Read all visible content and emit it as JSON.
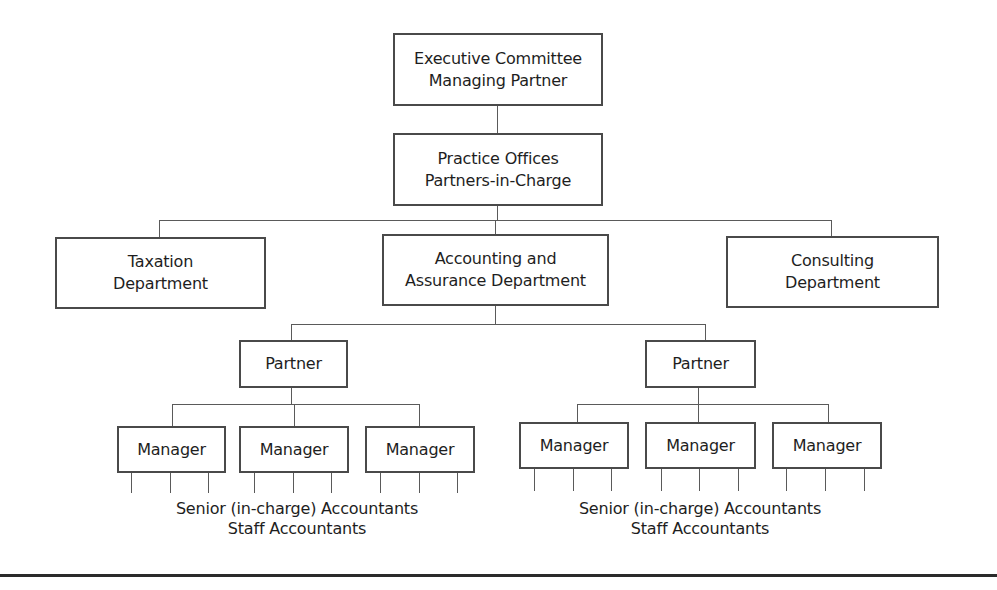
{
  "diagram": {
    "type": "org-chart",
    "title": "",
    "nodes": {
      "executive": {
        "line1": "Executive Committee",
        "line2": "Managing Partner"
      },
      "practice": {
        "line1": "Practice Offices",
        "line2": "Partners-in-Charge"
      },
      "taxation": {
        "line1": "Taxation",
        "line2": "Department"
      },
      "accounting": {
        "line1": "Accounting and",
        "line2": "Assurance Department"
      },
      "consulting": {
        "line1": "Consulting",
        "line2": "Department"
      },
      "partner_left": {
        "label": "Partner"
      },
      "partner_right": {
        "label": "Partner"
      },
      "managers_left": [
        {
          "label": "Manager"
        },
        {
          "label": "Manager"
        },
        {
          "label": "Manager"
        }
      ],
      "managers_right": [
        {
          "label": "Manager"
        },
        {
          "label": "Manager"
        },
        {
          "label": "Manager"
        }
      ]
    },
    "staff_left": {
      "line1": "Senior (in-charge) Accountants",
      "line2": "Staff Accountants"
    },
    "staff_right": {
      "line1": "Senior (in-charge) Accountants",
      "line2": "Staff Accountants"
    },
    "edges": [
      [
        "executive",
        "practice"
      ],
      [
        "practice",
        "taxation"
      ],
      [
        "practice",
        "accounting"
      ],
      [
        "practice",
        "consulting"
      ],
      [
        "accounting",
        "partner_left"
      ],
      [
        "accounting",
        "partner_right"
      ],
      [
        "partner_left",
        "managers_left"
      ],
      [
        "partner_right",
        "managers_right"
      ],
      [
        "managers_left",
        "staff_left"
      ],
      [
        "managers_right",
        "staff_right"
      ]
    ],
    "colors": {
      "line": "#4a4a4a",
      "text": "#1e1e1e",
      "background": "#ffffff"
    }
  }
}
